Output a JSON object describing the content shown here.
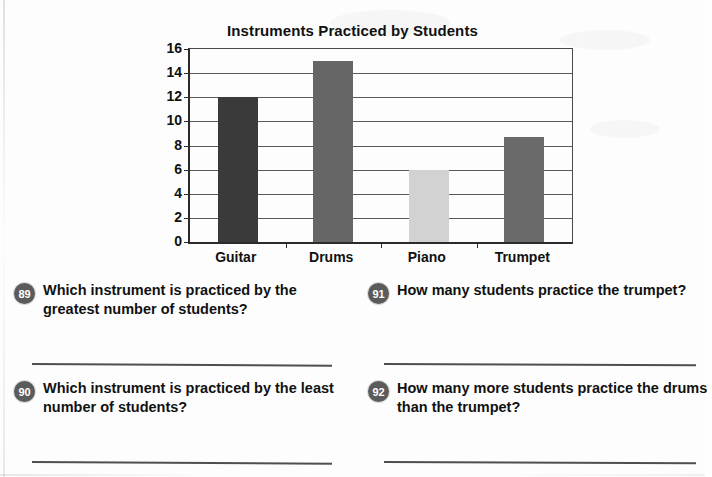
{
  "worksheet": {
    "page_background": "#fdfdfd",
    "text_color": "#111111"
  },
  "chart_data": {
    "type": "bar",
    "title": "Instruments Practiced by Students",
    "xlabel": "",
    "ylabel": "",
    "categories": [
      "Guitar",
      "Drums",
      "Piano",
      "Trumpet"
    ],
    "values": [
      12,
      15,
      6,
      8.7
    ],
    "bar_colors": [
      "#3a3a3a",
      "#666666",
      "#d2d2d2",
      "#6a6a6a"
    ],
    "ylim": [
      0,
      16
    ],
    "ytick_labels": [
      "0",
      "2",
      "4",
      "6",
      "8",
      "10",
      "12",
      "14",
      "16"
    ],
    "ytick_values": [
      0,
      2,
      4,
      6,
      8,
      10,
      12,
      14,
      16
    ],
    "grid": true,
    "legend": "none"
  },
  "questions": [
    {
      "number": "89",
      "text": "Which instrument is practiced by the greatest number of students?"
    },
    {
      "number": "91",
      "text": "How many students practice the trumpet?"
    },
    {
      "number": "90",
      "text": "Which instrument is practiced by the least number of students?"
    },
    {
      "number": "92",
      "text": "How many more students practice the drums than the trumpet?"
    }
  ]
}
